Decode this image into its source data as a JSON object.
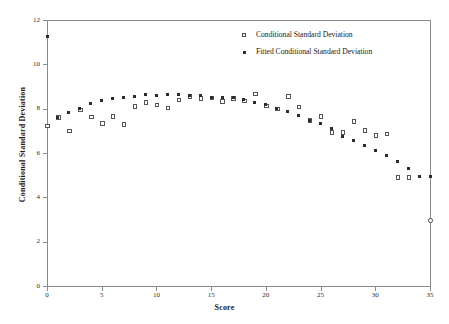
{
  "chart_data": {
    "type": "scatter",
    "title": "",
    "xlabel": "Score",
    "ylabel": "Conditional Standard Deviation",
    "xlim": [
      0,
      35
    ],
    "ylim": [
      0,
      12
    ],
    "xticks": [
      0,
      5,
      10,
      15,
      20,
      25,
      30,
      35
    ],
    "yticks": [
      0,
      2,
      4,
      6,
      8,
      10,
      12
    ],
    "xtick_labels": [
      "0",
      "5",
      "10",
      "15",
      "20",
      "25",
      "30",
      "35"
    ],
    "ytick_labels": [
      "0",
      "2",
      "4",
      "6",
      "8",
      "10",
      "12"
    ],
    "grid": false,
    "legend_position": "top-right",
    "colors": {
      "observed": "#555555",
      "fitted": "#2b2b2b",
      "axis": "#8a8a8a",
      "text": "#1a1a1a",
      "background": "#ffffff"
    },
    "series": [
      {
        "name": "Conditional Standard Deviation",
        "marker": "open-square",
        "x": [
          0,
          1,
          2,
          3,
          4,
          5,
          6,
          7,
          8,
          9,
          10,
          11,
          12,
          13,
          14,
          15,
          16,
          17,
          18,
          19,
          20,
          21,
          22,
          23,
          24,
          25,
          26,
          27,
          28,
          29,
          30,
          31,
          32,
          33,
          35
        ],
        "y": [
          7.25,
          7.62,
          7.02,
          7.98,
          7.65,
          7.35,
          7.67,
          7.32,
          8.12,
          8.3,
          8.2,
          8.07,
          8.42,
          8.58,
          8.48,
          8.5,
          8.35,
          8.48,
          8.38,
          8.68,
          8.15,
          8.0,
          8.58,
          8.1,
          7.5,
          7.68,
          6.95,
          6.95,
          7.45,
          7.05,
          6.82,
          6.88,
          4.93,
          4.93,
          2.98
        ]
      },
      {
        "name": "Fitted Conditional Standard Deviation",
        "marker": "filled-square",
        "x": [
          0,
          1,
          2,
          3,
          4,
          5,
          6,
          7,
          8,
          9,
          10,
          11,
          12,
          13,
          14,
          15,
          16,
          17,
          18,
          19,
          20,
          21,
          22,
          23,
          24,
          25,
          26,
          27,
          28,
          29,
          30,
          31,
          32,
          33,
          34,
          35
        ],
        "y": [
          11.25,
          7.6,
          7.83,
          8.0,
          8.22,
          8.35,
          8.45,
          8.5,
          8.56,
          8.62,
          8.6,
          8.63,
          8.63,
          8.6,
          8.58,
          8.5,
          8.52,
          8.5,
          8.4,
          8.28,
          8.18,
          8.02,
          7.85,
          7.68,
          7.48,
          7.33,
          7.12,
          6.73,
          6.55,
          6.35,
          6.12,
          5.88,
          5.6,
          5.3,
          4.93,
          4.93
        ]
      }
    ],
    "legend": [
      {
        "label": "Conditional Standard Deviation",
        "marker": "open-square"
      },
      {
        "label": "Fitted Conditional Standard Deviation",
        "marker": "filled-square"
      }
    ]
  }
}
